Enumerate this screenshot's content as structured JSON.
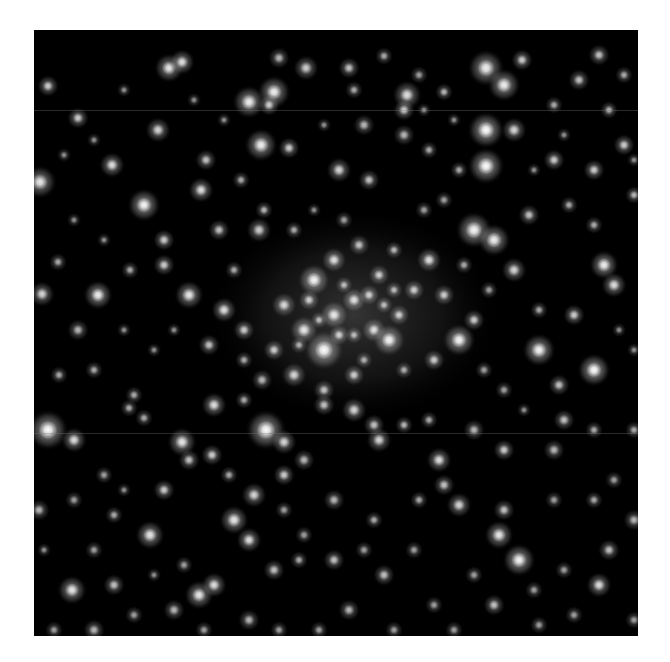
{
  "image": {
    "subject": "globular star cluster (grayscale astronomical image)",
    "background_color": "#000000",
    "page_color": "#ffffff",
    "star_color": "#ffffff",
    "frame": {
      "x": 34,
      "y": 30,
      "width": 604,
      "height": 606
    },
    "seams_y": [
      80,
      403
    ],
    "cluster_core": {
      "cx": 320,
      "cy": 285,
      "rx": 150,
      "ry": 110,
      "opacity": 0.28
    },
    "stars": [
      [
        135,
        38,
        8,
        0.85
      ],
      [
        148,
        32,
        7,
        0.8
      ],
      [
        215,
        72,
        9,
        0.9
      ],
      [
        240,
        62,
        9,
        0.9
      ],
      [
        124,
        100,
        7,
        0.75
      ],
      [
        14,
        56,
        6,
        0.7
      ],
      [
        44,
        88,
        6,
        0.7
      ],
      [
        6,
        152,
        9,
        0.85
      ],
      [
        78,
        135,
        7,
        0.8
      ],
      [
        272,
        38,
        7,
        0.7
      ],
      [
        315,
        38,
        6,
        0.65
      ],
      [
        245,
        28,
        6,
        0.6
      ],
      [
        350,
        26,
        5,
        0.55
      ],
      [
        320,
        60,
        5,
        0.55
      ],
      [
        452,
        38,
        10,
        0.9
      ],
      [
        470,
        55,
        9,
        0.9
      ],
      [
        488,
        30,
        6,
        0.7
      ],
      [
        410,
        62,
        5,
        0.6
      ],
      [
        452,
        100,
        10,
        1.0
      ],
      [
        452,
        136,
        10,
        1.0
      ],
      [
        480,
        100,
        7,
        0.75
      ],
      [
        545,
        50,
        6,
        0.65
      ],
      [
        565,
        25,
        6,
        0.65
      ],
      [
        575,
        80,
        5,
        0.6
      ],
      [
        520,
        75,
        5,
        0.55
      ],
      [
        590,
        45,
        5,
        0.55
      ],
      [
        235,
        75,
        6,
        0.7
      ],
      [
        227,
        115,
        9,
        0.9
      ],
      [
        255,
        118,
        6,
        0.7
      ],
      [
        172,
        130,
        6,
        0.65
      ],
      [
        167,
        160,
        7,
        0.8
      ],
      [
        207,
        150,
        5,
        0.55
      ],
      [
        330,
        95,
        6,
        0.6
      ],
      [
        305,
        140,
        7,
        0.75
      ],
      [
        335,
        150,
        6,
        0.65
      ],
      [
        370,
        105,
        6,
        0.6
      ],
      [
        395,
        120,
        5,
        0.55
      ],
      [
        373,
        65,
        8,
        0.8
      ],
      [
        370,
        80,
        6,
        0.7
      ],
      [
        385,
        45,
        5,
        0.5
      ],
      [
        425,
        140,
        5,
        0.55
      ],
      [
        520,
        130,
        6,
        0.7
      ],
      [
        560,
        140,
        6,
        0.7
      ],
      [
        590,
        115,
        6,
        0.7
      ],
      [
        600,
        165,
        5,
        0.6
      ],
      [
        495,
        185,
        6,
        0.65
      ],
      [
        535,
        175,
        5,
        0.55
      ],
      [
        560,
        195,
        5,
        0.55
      ],
      [
        110,
        175,
        9,
        0.95
      ],
      [
        130,
        210,
        6,
        0.7
      ],
      [
        64,
        265,
        8,
        0.9
      ],
      [
        130,
        235,
        6,
        0.7
      ],
      [
        96,
        240,
        5,
        0.55
      ],
      [
        24,
        232,
        5,
        0.55
      ],
      [
        8,
        264,
        7,
        0.75
      ],
      [
        44,
        300,
        6,
        0.6
      ],
      [
        155,
        265,
        8,
        0.85
      ],
      [
        190,
        280,
        7,
        0.8
      ],
      [
        210,
        300,
        6,
        0.7
      ],
      [
        175,
        315,
        6,
        0.65
      ],
      [
        185,
        200,
        6,
        0.65
      ],
      [
        225,
        200,
        7,
        0.7
      ],
      [
        230,
        180,
        5,
        0.6
      ],
      [
        280,
        250,
        9,
        0.95
      ],
      [
        300,
        230,
        7,
        0.8
      ],
      [
        250,
        275,
        7,
        0.75
      ],
      [
        270,
        300,
        8,
        0.85
      ],
      [
        290,
        320,
        11,
        1.0
      ],
      [
        300,
        285,
        8,
        0.85
      ],
      [
        320,
        270,
        7,
        0.8
      ],
      [
        340,
        300,
        7,
        0.8
      ],
      [
        355,
        310,
        9,
        0.95
      ],
      [
        365,
        285,
        6,
        0.7
      ],
      [
        380,
        260,
        6,
        0.7
      ],
      [
        345,
        245,
        6,
        0.7
      ],
      [
        325,
        215,
        6,
        0.65
      ],
      [
        360,
        220,
        5,
        0.6
      ],
      [
        395,
        230,
        7,
        0.8
      ],
      [
        410,
        265,
        6,
        0.7
      ],
      [
        425,
        310,
        9,
        0.95
      ],
      [
        440,
        290,
        6,
        0.7
      ],
      [
        400,
        330,
        6,
        0.7
      ],
      [
        240,
        320,
        6,
        0.7
      ],
      [
        260,
        345,
        7,
        0.75
      ],
      [
        320,
        345,
        6,
        0.7
      ],
      [
        290,
        360,
        6,
        0.65
      ],
      [
        228,
        350,
        6,
        0.6
      ],
      [
        210,
        330,
        5,
        0.55
      ],
      [
        440,
        200,
        10,
        0.95
      ],
      [
        460,
        210,
        9,
        0.9
      ],
      [
        480,
        240,
        7,
        0.75
      ],
      [
        505,
        320,
        9,
        0.95
      ],
      [
        570,
        235,
        8,
        0.9
      ],
      [
        580,
        255,
        7,
        0.8
      ],
      [
        540,
        285,
        6,
        0.7
      ],
      [
        505,
        280,
        5,
        0.55
      ],
      [
        525,
        355,
        6,
        0.65
      ],
      [
        560,
        340,
        9,
        1.0
      ],
      [
        530,
        390,
        6,
        0.65
      ],
      [
        560,
        400,
        5,
        0.55
      ],
      [
        520,
        420,
        6,
        0.6
      ],
      [
        14,
        400,
        11,
        1.0
      ],
      [
        40,
        410,
        7,
        0.8
      ],
      [
        232,
        400,
        11,
        1.0
      ],
      [
        250,
        412,
        7,
        0.75
      ],
      [
        148,
        412,
        8,
        0.85
      ],
      [
        178,
        425,
        6,
        0.7
      ],
      [
        110,
        388,
        5,
        0.55
      ],
      [
        95,
        378,
        5,
        0.55
      ],
      [
        180,
        375,
        7,
        0.8
      ],
      [
        210,
        370,
        5,
        0.55
      ],
      [
        290,
        375,
        6,
        0.65
      ],
      [
        320,
        380,
        7,
        0.75
      ],
      [
        345,
        410,
        7,
        0.75
      ],
      [
        340,
        395,
        6,
        0.65
      ],
      [
        370,
        395,
        5,
        0.6
      ],
      [
        395,
        390,
        5,
        0.55
      ],
      [
        470,
        420,
        6,
        0.7
      ],
      [
        440,
        400,
        6,
        0.6
      ],
      [
        600,
        400,
        5,
        0.55
      ],
      [
        100,
        365,
        5,
        0.55
      ],
      [
        60,
        340,
        5,
        0.55
      ],
      [
        25,
        345,
        5,
        0.55
      ],
      [
        5,
        480,
        6,
        0.6
      ],
      [
        40,
        470,
        5,
        0.5
      ],
      [
        80,
        485,
        5,
        0.55
      ],
      [
        116,
        505,
        8,
        0.85
      ],
      [
        130,
        460,
        6,
        0.7
      ],
      [
        155,
        430,
        6,
        0.65
      ],
      [
        60,
        520,
        5,
        0.5
      ],
      [
        10,
        520,
        4,
        0.45
      ],
      [
        38,
        560,
        8,
        0.85
      ],
      [
        80,
        555,
        6,
        0.65
      ],
      [
        20,
        600,
        5,
        0.5
      ],
      [
        60,
        600,
        6,
        0.6
      ],
      [
        100,
        585,
        5,
        0.5
      ],
      [
        140,
        580,
        6,
        0.6
      ],
      [
        165,
        565,
        8,
        0.85
      ],
      [
        180,
        555,
        7,
        0.8
      ],
      [
        200,
        490,
        8,
        0.85
      ],
      [
        215,
        510,
        7,
        0.8
      ],
      [
        220,
        465,
        7,
        0.75
      ],
      [
        250,
        445,
        6,
        0.7
      ],
      [
        270,
        430,
        6,
        0.6
      ],
      [
        195,
        445,
        5,
        0.55
      ],
      [
        240,
        540,
        6,
        0.65
      ],
      [
        265,
        530,
        5,
        0.55
      ],
      [
        215,
        590,
        6,
        0.6
      ],
      [
        245,
        600,
        5,
        0.5
      ],
      [
        170,
        600,
        5,
        0.5
      ],
      [
        300,
        470,
        6,
        0.6
      ],
      [
        300,
        530,
        6,
        0.65
      ],
      [
        315,
        580,
        6,
        0.6
      ],
      [
        340,
        490,
        5,
        0.55
      ],
      [
        350,
        545,
        6,
        0.65
      ],
      [
        385,
        470,
        5,
        0.55
      ],
      [
        405,
        430,
        7,
        0.8
      ],
      [
        425,
        475,
        7,
        0.75
      ],
      [
        410,
        455,
        6,
        0.65
      ],
      [
        470,
        480,
        6,
        0.65
      ],
      [
        465,
        505,
        8,
        0.85
      ],
      [
        485,
        530,
        9,
        0.95
      ],
      [
        440,
        545,
        5,
        0.5
      ],
      [
        460,
        575,
        6,
        0.65
      ],
      [
        400,
        575,
        5,
        0.5
      ],
      [
        360,
        600,
        5,
        0.5
      ],
      [
        505,
        595,
        5,
        0.5
      ],
      [
        540,
        585,
        5,
        0.5
      ],
      [
        565,
        555,
        7,
        0.8
      ],
      [
        575,
        520,
        6,
        0.65
      ],
      [
        600,
        490,
        6,
        0.6
      ],
      [
        560,
        470,
        5,
        0.55
      ],
      [
        580,
        450,
        5,
        0.5
      ],
      [
        520,
        470,
        5,
        0.5
      ],
      [
        530,
        540,
        5,
        0.5
      ],
      [
        600,
        590,
        5,
        0.5
      ],
      [
        500,
        560,
        5,
        0.5
      ],
      [
        420,
        600,
        5,
        0.5
      ],
      [
        285,
        600,
        5,
        0.5
      ],
      [
        330,
        520,
        5,
        0.5
      ],
      [
        380,
        520,
        5,
        0.5
      ],
      [
        150,
        535,
        5,
        0.5
      ],
      [
        120,
        545,
        4,
        0.45
      ],
      [
        70,
        445,
        5,
        0.5
      ],
      [
        90,
        460,
        4,
        0.45
      ],
      [
        250,
        480,
        5,
        0.5
      ],
      [
        270,
        505,
        5,
        0.5
      ],
      [
        390,
        80,
        4,
        0.45
      ],
      [
        420,
        90,
        4,
        0.45
      ],
      [
        290,
        95,
        4,
        0.45
      ],
      [
        190,
        90,
        4,
        0.45
      ],
      [
        160,
        70,
        4,
        0.45
      ],
      [
        90,
        60,
        4,
        0.45
      ],
      [
        60,
        110,
        4,
        0.45
      ],
      [
        30,
        125,
        4,
        0.45
      ],
      [
        500,
        140,
        4,
        0.45
      ],
      [
        530,
        105,
        4,
        0.45
      ],
      [
        600,
        130,
        4,
        0.45
      ],
      [
        585,
        300,
        4,
        0.45
      ],
      [
        600,
        320,
        4,
        0.45
      ],
      [
        470,
        360,
        5,
        0.5
      ],
      [
        450,
        340,
        5,
        0.5
      ],
      [
        490,
        380,
        4,
        0.45
      ],
      [
        140,
        300,
        4,
        0.45
      ],
      [
        120,
        320,
        4,
        0.45
      ],
      [
        90,
        300,
        4,
        0.45
      ],
      [
        70,
        210,
        4,
        0.45
      ],
      [
        40,
        190,
        4,
        0.45
      ],
      [
        200,
        240,
        5,
        0.55
      ],
      [
        260,
        200,
        5,
        0.55
      ],
      [
        280,
        180,
        4,
        0.45
      ],
      [
        310,
        190,
        5,
        0.5
      ],
      [
        390,
        180,
        5,
        0.5
      ],
      [
        410,
        170,
        5,
        0.5
      ],
      [
        430,
        235,
        5,
        0.55
      ],
      [
        455,
        260,
        5,
        0.5
      ],
      [
        370,
        340,
        5,
        0.55
      ],
      [
        330,
        330,
        5,
        0.55
      ],
      [
        305,
        305,
        6,
        0.7
      ],
      [
        275,
        270,
        6,
        0.7
      ],
      [
        310,
        255,
        5,
        0.6
      ],
      [
        335,
        265,
        6,
        0.7
      ],
      [
        350,
        275,
        5,
        0.6
      ],
      [
        360,
        260,
        5,
        0.6
      ],
      [
        285,
        290,
        5,
        0.6
      ],
      [
        265,
        315,
        5,
        0.55
      ],
      [
        320,
        305,
        5,
        0.6
      ]
    ]
  }
}
